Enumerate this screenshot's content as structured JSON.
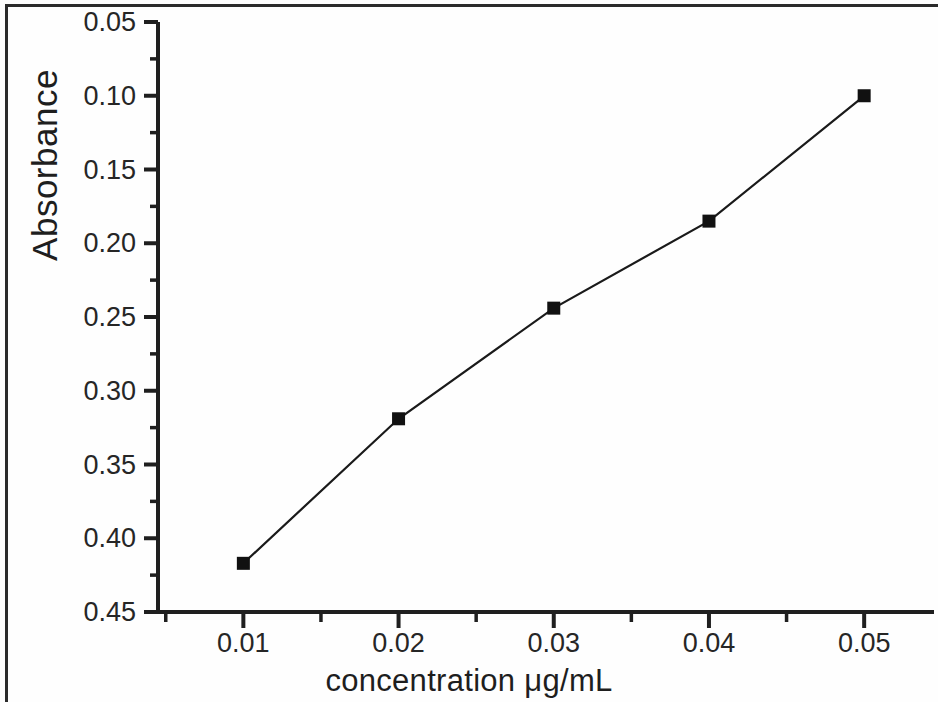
{
  "chart_data": {
    "type": "line",
    "title": "",
    "subtitle": "",
    "xlabel": "concentration μg/mL",
    "ylabel": "Absorbance",
    "x": [
      0.01,
      0.02,
      0.03,
      0.04,
      0.05
    ],
    "categories": [
      "0.01",
      "0.02",
      "0.03",
      "0.04",
      "0.05"
    ],
    "values": [
      0.083,
      0.181,
      0.256,
      0.315,
      0.4
    ],
    "series": [
      {
        "name": "Absorbance",
        "values": [
          0.083,
          0.181,
          0.256,
          0.315,
          0.4
        ]
      }
    ],
    "xlim": [
      0.0045,
      0.0545
    ],
    "ylim": [
      0.05,
      0.45
    ],
    "xticks": [
      0.01,
      0.02,
      0.03,
      0.04,
      0.05
    ],
    "xtick_labels": [
      "0.01",
      "0.02",
      "0.03",
      "0.04",
      "0.05"
    ],
    "yticks": [
      0.05,
      0.1,
      0.15,
      0.2,
      0.25,
      0.3,
      0.35,
      0.4,
      0.45
    ],
    "ytick_labels": [
      "0.05",
      "0.10",
      "0.15",
      "0.20",
      "0.25",
      "0.30",
      "0.35",
      "0.40",
      "0.45"
    ],
    "minor_ticks": true,
    "grid": false,
    "legend": false,
    "legend_position": "none",
    "marker": "filled-square",
    "line_color": "#1a1a1a",
    "marker_color": "#111111",
    "axis_color": "#1f1f1f",
    "background_color": "#fefefe"
  },
  "axes": {
    "y_title": "Absorbance",
    "x_title": "concentration μg/mL",
    "y_ticks": [
      "0.45",
      "0.40",
      "0.35",
      "0.30",
      "0.25",
      "0.20",
      "0.15",
      "0.10",
      "0.05"
    ],
    "x_ticks": [
      "0.01",
      "0.02",
      "0.03",
      "0.04",
      "0.05"
    ]
  }
}
